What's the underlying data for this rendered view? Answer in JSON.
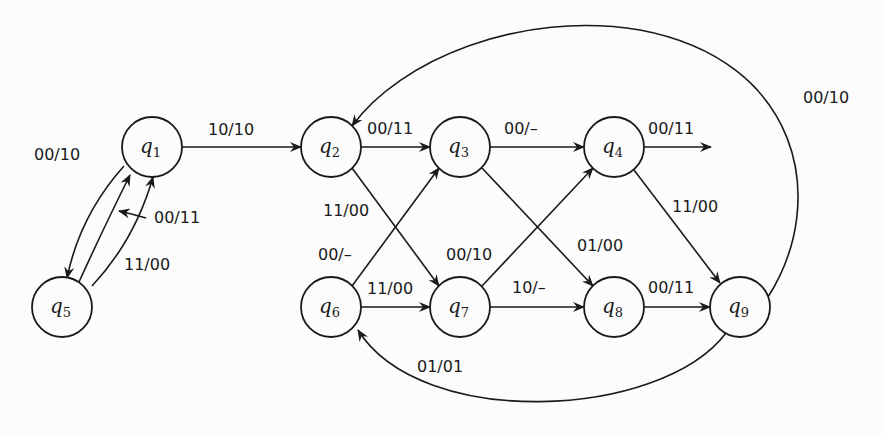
{
  "diagram": {
    "type": "state-transition-graph",
    "nodes": [
      {
        "id": "q1",
        "name": "q",
        "sub": "1",
        "x": 152,
        "y": 147
      },
      {
        "id": "q2",
        "name": "q",
        "sub": "2",
        "x": 331,
        "y": 147
      },
      {
        "id": "q3",
        "name": "q",
        "sub": "3",
        "x": 460,
        "y": 147
      },
      {
        "id": "q4",
        "name": "q",
        "sub": "4",
        "x": 614,
        "y": 147
      },
      {
        "id": "q5",
        "name": "q",
        "sub": "5",
        "x": 62,
        "y": 307
      },
      {
        "id": "q6",
        "name": "q",
        "sub": "6",
        "x": 331,
        "y": 307
      },
      {
        "id": "q7",
        "name": "q",
        "sub": "7",
        "x": 460,
        "y": 307
      },
      {
        "id": "q8",
        "name": "q",
        "sub": "8",
        "x": 614,
        "y": 307
      },
      {
        "id": "q9",
        "name": "q",
        "sub": "9",
        "x": 740,
        "y": 307
      }
    ],
    "edges": [
      {
        "from": "q1",
        "to": "q5",
        "label": "00/10"
      },
      {
        "from": "q5",
        "to": "q1",
        "label": "00/11"
      },
      {
        "from": "q5",
        "to": "q1",
        "label": "11/00"
      },
      {
        "from": "q1",
        "to": "q2",
        "label": "10/10"
      },
      {
        "from": "q2",
        "to": "q3",
        "label": "00/11"
      },
      {
        "from": "q2",
        "to": "q7",
        "label": "11/00"
      },
      {
        "from": "q3",
        "to": "q4",
        "label": "00/–"
      },
      {
        "from": "q3",
        "to": "q8",
        "label": "01/00"
      },
      {
        "from": "q4",
        "to": "out",
        "label": "00/11"
      },
      {
        "from": "q4",
        "to": "q9",
        "label": "11/00"
      },
      {
        "from": "q6",
        "to": "q3",
        "label": "00/–"
      },
      {
        "from": "q6",
        "to": "q7",
        "label": "11/00"
      },
      {
        "from": "q7",
        "to": "q4",
        "label": "00/10"
      },
      {
        "from": "q7",
        "to": "q8",
        "label": "10/–"
      },
      {
        "from": "q8",
        "to": "q9",
        "label": "00/11"
      },
      {
        "from": "q9",
        "to": "q2",
        "label": "00/10"
      },
      {
        "from": "q9",
        "to": "q6",
        "label": "01/01"
      }
    ]
  }
}
